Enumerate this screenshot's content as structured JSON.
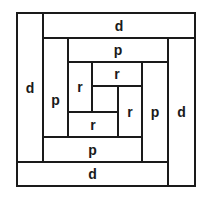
{
  "diagram": {
    "title": "",
    "blocks": [
      {
        "id": "d-top",
        "label": "d"
      },
      {
        "id": "d-left",
        "label": "d"
      },
      {
        "id": "d-bottom",
        "label": "d"
      },
      {
        "id": "d-right",
        "label": "d"
      },
      {
        "id": "p-top",
        "label": "p"
      },
      {
        "id": "p-left",
        "label": "p"
      },
      {
        "id": "p-bottom",
        "label": "p"
      },
      {
        "id": "p-right",
        "label": "p"
      },
      {
        "id": "r-top",
        "label": "r"
      },
      {
        "id": "r-left",
        "label": "r"
      },
      {
        "id": "r-bottom",
        "label": "r"
      },
      {
        "id": "r-right",
        "label": "r"
      },
      {
        "id": "center",
        "label": ""
      }
    ]
  }
}
